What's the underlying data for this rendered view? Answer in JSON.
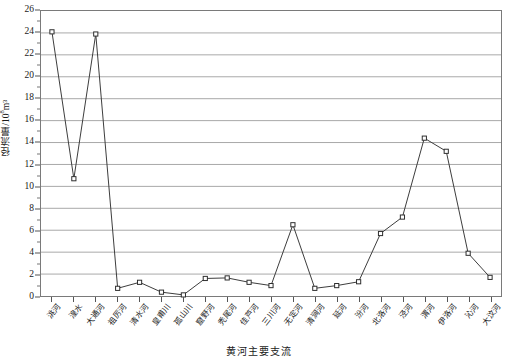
{
  "chart_data": {
    "type": "line",
    "title": "",
    "xlabel": "黄河主要支流",
    "ylabel": "径流量/10⁸m³",
    "ylabel_base": "径流量/10",
    "ylabel_sup": "8",
    "ylabel_tail": "m³",
    "ylim": [
      0,
      26
    ],
    "ytick_step": 2,
    "yticks": [
      0,
      2,
      4,
      6,
      8,
      10,
      12,
      14,
      16,
      18,
      20,
      22,
      24,
      26
    ],
    "ytick_labels": [
      "0",
      "2",
      "4",
      "6",
      "8",
      "10",
      "12",
      "14",
      "16",
      "18",
      "20",
      "22",
      "24",
      "26"
    ],
    "grid": true,
    "grid_axis": "y",
    "legend": "none",
    "marker": "open-square",
    "line_color": "#3b3b3b",
    "grid_color": "#a8a8a8",
    "categories": [
      "洮河",
      "湟水",
      "大通河",
      "祖厉河",
      "清水河",
      "皇甫川",
      "孤山川",
      "窟野河",
      "秃尾河",
      "佳芦河",
      "三川河",
      "无定河",
      "清涧河",
      "延河",
      "汾河",
      "北洛河",
      "泾河",
      "渭河",
      "伊洛河",
      "沁河",
      "大汶河"
    ],
    "values": [
      24.1,
      10.7,
      23.9,
      0.7,
      1.25,
      0.35,
      0.1,
      1.6,
      1.65,
      1.25,
      0.95,
      6.5,
      0.7,
      0.95,
      1.3,
      5.7,
      7.2,
      14.4,
      13.2,
      3.9,
      1.7
    ],
    "series": [
      {
        "name": "径流量",
        "values": [
          24.1,
          10.7,
          23.9,
          0.7,
          1.25,
          0.35,
          0.1,
          1.6,
          1.65,
          1.25,
          0.95,
          6.5,
          0.7,
          0.95,
          1.3,
          5.7,
          7.2,
          14.4,
          13.2,
          3.9,
          1.7
        ]
      }
    ]
  }
}
